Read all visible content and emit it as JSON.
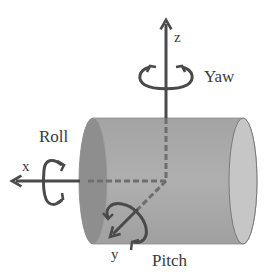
{
  "diagram": {
    "type": "rotation-axes",
    "axes": [
      {
        "id": "z",
        "label": "z",
        "rotation": "Yaw"
      },
      {
        "id": "x",
        "label": "x",
        "rotation": "Roll"
      },
      {
        "id": "y",
        "label": "y",
        "rotation": "Pitch"
      }
    ],
    "labels": {
      "z": "z",
      "x": "x",
      "y": "y",
      "yaw": "Yaw",
      "roll": "Roll",
      "pitch": "Pitch"
    },
    "colors": {
      "axis": "#4a4a4a",
      "cylinder_body": "#a9a9a9",
      "cylinder_left_face": "#8f8f8f",
      "cylinder_right_face": "#c4c4c4",
      "dashed_hidden": "#6e6e6e",
      "text": "#3a3a3a"
    }
  }
}
